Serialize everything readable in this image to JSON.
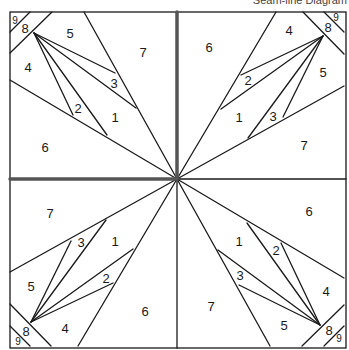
{
  "caption": "Seam-line Diagram",
  "colors": {
    "line": "#1a1a1a",
    "seam": "#555555",
    "background": "#ffffff"
  },
  "block": {
    "left": 10,
    "top": 12,
    "right": 346,
    "bottom": 348,
    "center": [
      177,
      179
    ]
  },
  "quadrant_labels": [
    {
      "text": "9",
      "x": 15,
      "y": 20,
      "small": true
    },
    {
      "text": "8",
      "x": 25,
      "y": 28
    },
    {
      "text": "5",
      "x": 70,
      "y": 33
    },
    {
      "text": "7",
      "x": 143,
      "y": 52
    },
    {
      "text": "4",
      "x": 28,
      "y": 67
    },
    {
      "text": "3",
      "x": 114,
      "y": 83
    },
    {
      "text": "2",
      "x": 78,
      "y": 108
    },
    {
      "text": "1",
      "x": 115,
      "y": 117
    },
    {
      "text": "6",
      "x": 45,
      "y": 147
    }
  ],
  "quadrants": [
    {
      "name": "top-left",
      "rotation": 0
    },
    {
      "name": "top-right",
      "rotation": 90
    },
    {
      "name": "bottom-right",
      "rotation": 180
    },
    {
      "name": "bottom-left",
      "rotation": 270
    }
  ]
}
